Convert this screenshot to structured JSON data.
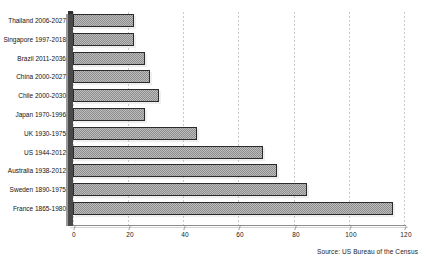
{
  "chart_data": {
    "type": "bar",
    "orientation": "horizontal",
    "title": "",
    "xlabel": "",
    "ylabel": "",
    "xlim": [
      0,
      120
    ],
    "xticks": [
      "0",
      "20",
      "40",
      "60",
      "80",
      "100",
      "120"
    ],
    "grid": true,
    "legend": null,
    "categories": [
      "Thailand  2006-2027",
      "Singapore  1997-2018",
      "Brazil  2011-2036",
      "China  2000-2027",
      "Chile  2000-2030",
      "Japan  1970-1996",
      "UK  1930-1975",
      "US  1944-2012",
      "Australia  1938-2012",
      "Sweden  1890-1975",
      "France  1865-1980"
    ],
    "values": [
      22,
      22,
      26,
      28,
      31,
      26,
      45,
      69,
      74,
      85,
      116
    ],
    "series": [
      {
        "name": "Years to age",
        "values": [
          22,
          22,
          26,
          28,
          31,
          26,
          45,
          69,
          74,
          85,
          116
        ]
      }
    ],
    "annotations": {
      "source": "Source:  US Bureau of the Census"
    },
    "colors": {
      "bar_fill": "#bdbdbd",
      "bar_pattern": "#8d8d8d",
      "bar_border": "#2b2b2b",
      "axis": "#4a4a4a",
      "grid": "#c9c9c9",
      "text": "#121212",
      "background": "#ffffff"
    }
  }
}
